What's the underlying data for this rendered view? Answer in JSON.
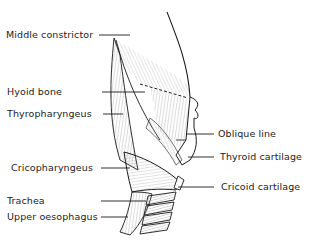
{
  "diagram": {
    "type": "anatomical-illustration",
    "labels_left": [
      {
        "id": "middle-constrictor",
        "text": "Middle constrictor"
      },
      {
        "id": "hyoid-bone",
        "text": "Hyoid bone"
      },
      {
        "id": "thyropharyngeus",
        "text": "Thyropharyngeus"
      },
      {
        "id": "cricopharyngeus",
        "text": "Cricopharyngeus"
      },
      {
        "id": "trachea",
        "text": "Trachea"
      },
      {
        "id": "upper-oesophagus",
        "text": "Upper oesophagus"
      }
    ],
    "labels_right": [
      {
        "id": "oblique-line",
        "text": "Oblique line"
      },
      {
        "id": "thyroid-cartilage",
        "text": "Thyroid cartilage"
      },
      {
        "id": "cricoid-cartilage",
        "text": "Cricoid cartilage"
      }
    ],
    "colors": {
      "line": "#1a1a1a",
      "hatch": "#777777",
      "background": "#ffffff"
    }
  }
}
